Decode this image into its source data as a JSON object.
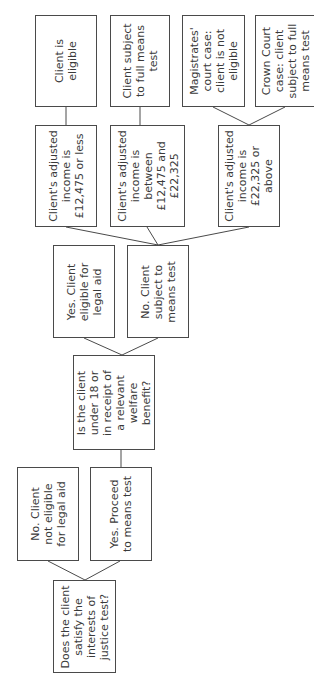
{
  "diagram": {
    "orientation": "rotated-90-ccw",
    "nodes": {
      "q_interests": {
        "lines": [
          "Does the client",
          "satisfy the",
          "interests of",
          "justice test?"
        ]
      },
      "no_not_eligible": {
        "lines": [
          "No. Client",
          "not eligible",
          "for legal aid"
        ]
      },
      "yes_proceed": {
        "lines": [
          "Yes. Proceed",
          "to means test"
        ]
      },
      "q_under18": {
        "lines": [
          "Is the client",
          "under 18 or",
          "in receipt of",
          "a relevant",
          "welfare",
          "benefit?"
        ]
      },
      "yes_eligible": {
        "lines": [
          "Yes. Client",
          "eligible for",
          "legal aid"
        ]
      },
      "no_means_test": {
        "lines": [
          "No. Client",
          "subject to",
          "means test"
        ]
      },
      "income_low": {
        "lines": [
          "Client's adjusted",
          "income is",
          "£12,475 or less"
        ]
      },
      "income_mid": {
        "lines": [
          "Client's adjusted",
          "income is",
          "between",
          "£12,475 and",
          "£22,325"
        ]
      },
      "income_high": {
        "lines": [
          "Client's adjusted",
          "income is",
          "£22,325 or",
          "above"
        ]
      },
      "client_eligible": {
        "lines": [
          "Client is",
          "eligible"
        ]
      },
      "full_means_test": {
        "lines": [
          "Client subject",
          "to full means",
          "test"
        ]
      },
      "magistrates": {
        "lines": [
          "Magistrates'",
          "court case:",
          "client is not",
          "eligible"
        ]
      },
      "crown_court": {
        "lines": [
          "Crown Court",
          "case: client",
          "subject to full",
          "means test"
        ]
      }
    }
  }
}
